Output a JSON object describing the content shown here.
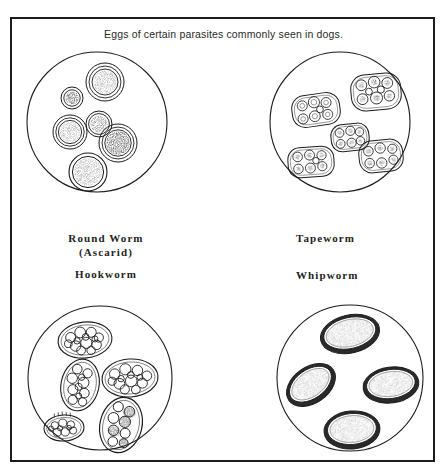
{
  "figure": {
    "title": "Eggs of certain parasites commonly seen in dogs.",
    "background_color": "#ffffff",
    "ink_color": "#1c1c1c",
    "frame": {
      "x": 10,
      "y": 17,
      "width": 425,
      "height": 445,
      "border_px": 2
    }
  },
  "labels": {
    "roundworm_line1": "Round Worm",
    "roundworm_line2": "(Ascarid)",
    "hookworm": "Hookworm",
    "tapeworm": "Tapeworm",
    "whipworm": "Whipworm"
  },
  "panels": [
    {
      "name": "roundworm-panel",
      "label": "Round Worm (Ascarid)",
      "circle": {
        "cx": 97,
        "cy": 122,
        "r": 70
      },
      "egg_style": "round-concentric-rings-stippled-center",
      "egg_count": 6,
      "eggs": [
        {
          "cx": 72,
          "cy": 98,
          "rx": 11,
          "ry": 11,
          "rings": 2,
          "fill": "dark-stipple"
        },
        {
          "cx": 105,
          "cy": 82,
          "rx": 19,
          "ry": 19,
          "rings": 3,
          "fill": "light-stipple"
        },
        {
          "cx": 70,
          "cy": 132,
          "rx": 17,
          "ry": 17,
          "rings": 3,
          "fill": "light-stipple"
        },
        {
          "cx": 99,
          "cy": 124,
          "rx": 13,
          "ry": 13,
          "rings": 2,
          "fill": "mid-stipple"
        },
        {
          "cx": 118,
          "cy": 143,
          "rx": 19,
          "ry": 19,
          "rings": 3,
          "fill": "dark-stipple"
        },
        {
          "cx": 88,
          "cy": 172,
          "rx": 19,
          "ry": 19,
          "rings": 2,
          "fill": "light-stipple"
        }
      ]
    },
    {
      "name": "tapeworm-panel",
      "label": "Tapeworm",
      "circle": {
        "cx": 340,
        "cy": 122,
        "r": 70
      },
      "egg_style": "rounded-rectangle-packet-with-cell-cluster",
      "egg_count": 5,
      "eggs": [
        {
          "cx": 316,
          "cy": 110,
          "rx": 24,
          "ry": 16,
          "rot": -8,
          "cells": 7
        },
        {
          "cx": 376,
          "cy": 92,
          "rx": 25,
          "ry": 18,
          "rot": -5,
          "cells": 8
        },
        {
          "cx": 349,
          "cy": 137,
          "rx": 19,
          "ry": 14,
          "rot": -6,
          "cells": 7
        },
        {
          "cx": 311,
          "cy": 162,
          "rx": 23,
          "ry": 15,
          "rot": -4,
          "cells": 7
        },
        {
          "cx": 381,
          "cy": 156,
          "rx": 22,
          "ry": 16,
          "rot": -6,
          "cells": 7
        }
      ]
    },
    {
      "name": "hookworm-panel",
      "label": "Hookworm",
      "circle": {
        "cx": 100,
        "cy": 378,
        "r": 72
      },
      "egg_style": "thin-shelled-oval-with-morula",
      "egg_count": 5,
      "eggs": [
        {
          "cx": 85,
          "cy": 340,
          "rx": 27,
          "ry": 18,
          "rot": -6,
          "cells": 13
        },
        {
          "cx": 80,
          "cy": 385,
          "rx": 19,
          "ry": 26,
          "rot": 12,
          "cells": 11
        },
        {
          "cx": 130,
          "cy": 378,
          "rx": 28,
          "ry": 19,
          "rot": -4,
          "cells": 13
        },
        {
          "cx": 64,
          "cy": 428,
          "rx": 20,
          "ry": 13,
          "rot": -3,
          "cells": 9
        },
        {
          "cx": 121,
          "cy": 425,
          "rx": 21,
          "ry": 28,
          "rot": 14,
          "cells": 12
        }
      ]
    },
    {
      "name": "whipworm-panel",
      "label": "Whipworm",
      "circle": {
        "cx": 350,
        "cy": 378,
        "r": 73
      },
      "egg_style": "barrel-shaped-thick-dark-rim-light-stipple",
      "egg_count": 4,
      "eggs": [
        {
          "cx": 350,
          "cy": 334,
          "rx": 30,
          "ry": 19,
          "rot": -13
        },
        {
          "cx": 311,
          "cy": 385,
          "rx": 27,
          "ry": 18,
          "rot": -35
        },
        {
          "cx": 391,
          "cy": 385,
          "rx": 28,
          "ry": 18,
          "rot": -8
        },
        {
          "cx": 352,
          "cy": 430,
          "rx": 28,
          "ry": 19,
          "rot": -5
        }
      ]
    }
  ]
}
